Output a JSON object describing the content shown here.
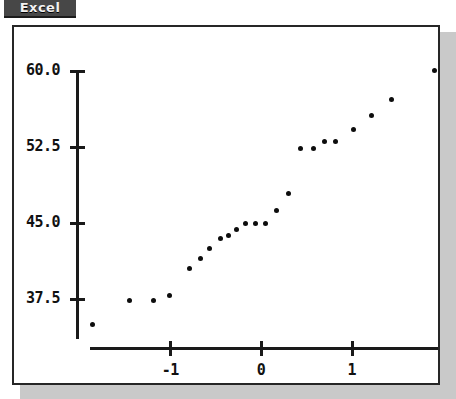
{
  "app": {
    "badge_label": "Excel",
    "badge_bg": "#474747",
    "badge_text_color": "#f2f2f2"
  },
  "panel": {
    "background": "#ffffff",
    "border_color": "#262626",
    "shadow_color": "#c9c9c9"
  },
  "chart_data": {
    "type": "scatter",
    "title": "",
    "subtitle": "",
    "xlabel": "",
    "ylabel": "",
    "marker_color": "#0d0d0d",
    "axis_color": "#1a1a1a",
    "grid": false,
    "legend": null,
    "xlim": [
      -1.85,
      1.95
    ],
    "ylim": [
      33.5,
      61.2
    ],
    "xticks": [
      -1,
      0,
      1
    ],
    "xticklabels": [
      "-1",
      "0",
      "1"
    ],
    "yticks": [
      37.5,
      45.0,
      52.5,
      60.0
    ],
    "yticklabels": [
      "37.5",
      "45.0",
      "52.5",
      "60.0"
    ],
    "points": [
      {
        "x": -1.85,
        "y": 34.9
      },
      {
        "x": -1.44,
        "y": 37.3
      },
      {
        "x": -1.18,
        "y": 37.3
      },
      {
        "x": -1.0,
        "y": 37.8
      },
      {
        "x": -0.78,
        "y": 40.4
      },
      {
        "x": -0.66,
        "y": 41.4
      },
      {
        "x": -0.56,
        "y": 42.4
      },
      {
        "x": -0.44,
        "y": 43.4
      },
      {
        "x": -0.35,
        "y": 43.7
      },
      {
        "x": -0.26,
        "y": 44.3
      },
      {
        "x": -0.16,
        "y": 44.9
      },
      {
        "x": -0.06,
        "y": 44.9
      },
      {
        "x": 0.06,
        "y": 44.9
      },
      {
        "x": 0.18,
        "y": 46.2
      },
      {
        "x": 0.31,
        "y": 47.8
      },
      {
        "x": 0.44,
        "y": 52.3
      },
      {
        "x": 0.58,
        "y": 52.3
      },
      {
        "x": 0.71,
        "y": 53.0
      },
      {
        "x": 0.83,
        "y": 53.0
      },
      {
        "x": 1.02,
        "y": 54.2
      },
      {
        "x": 1.22,
        "y": 55.6
      },
      {
        "x": 1.44,
        "y": 57.1
      },
      {
        "x": 1.92,
        "y": 60.0
      }
    ]
  }
}
